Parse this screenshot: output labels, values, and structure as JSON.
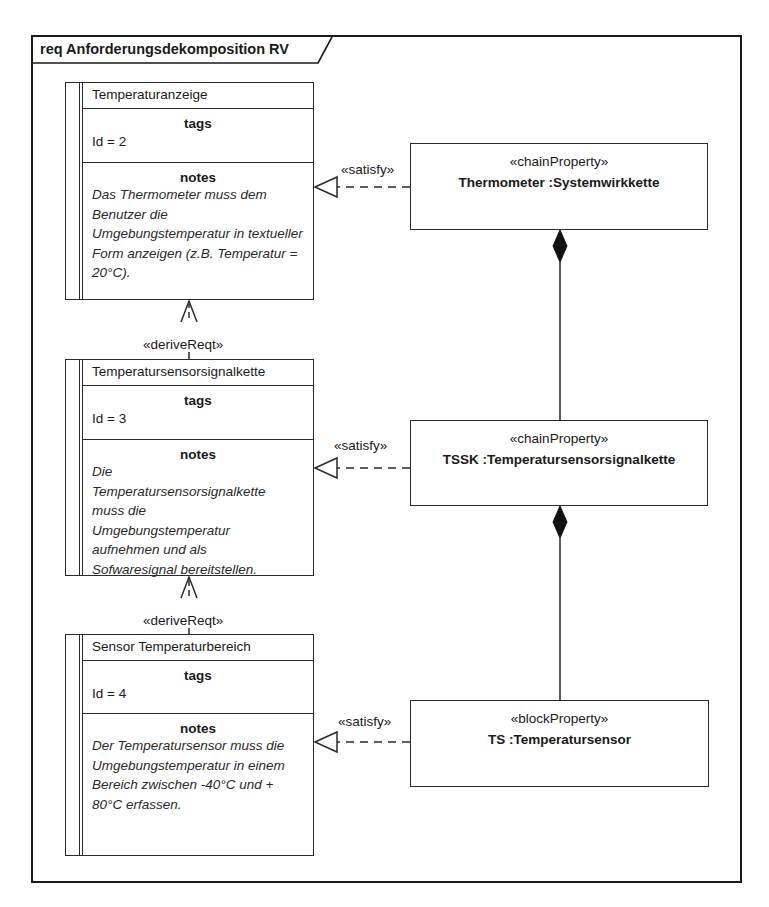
{
  "diagram": {
    "frame_title": "req Anforderungsdekomposition RV"
  },
  "requirements": [
    {
      "name": "Temperaturanzeige",
      "tags_title": "tags",
      "tag": "Id = 2",
      "notes_title": "notes",
      "notes": "Das Thermometer muss dem Benutzer die Umgebungstemperatur in textueller Form anzeigen (z.B. Temperatur = 20°C)."
    },
    {
      "name": "Temperatursensorsignalkette",
      "tags_title": "tags",
      "tag": "Id = 3",
      "notes_title": "notes",
      "notes": "Die Temperatursensorsignalkette muss die Umgebungstemperatur aufnehmen und als Sofwaresignal bereitstellen."
    },
    {
      "name": "Sensor Temperaturbereich",
      "tags_title": "tags",
      "tag": "Id = 4",
      "notes_title": "notes",
      "notes": "Der Temperatursensor muss die Umgebungstemperatur in einem Bereich zwischen -40°C und + 80°C erfassen."
    }
  ],
  "blocks": [
    {
      "stereotype": "«chainProperty»",
      "name": "Thermometer :Systemwirkkette"
    },
    {
      "stereotype": "«chainProperty»",
      "name": "TSSK :Temperatursensorsignalkette"
    },
    {
      "stereotype": "«blockProperty»",
      "name": "TS :Temperatursensor"
    }
  ],
  "relations": {
    "satisfy_label": "«satisfy»",
    "derive_label": "«deriveReqt»"
  }
}
